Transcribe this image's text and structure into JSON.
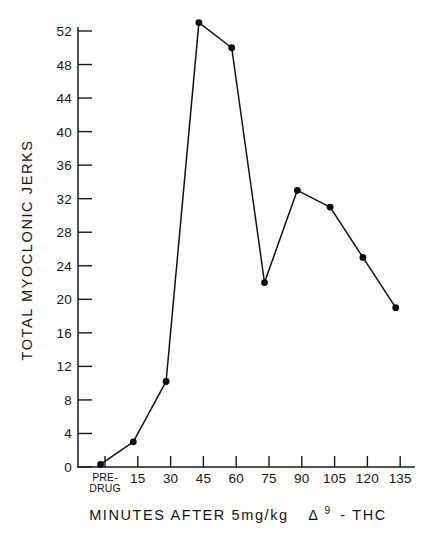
{
  "chart_data": {
    "type": "line",
    "title": "",
    "xlabel": "MINUTES AFTER  5mg/kg  Δ9 - THC",
    "xlabel_parts": {
      "main_prefix": "MINUTES  AFTER   5mg/kg",
      "delta": "Δ",
      "superscript": "9",
      "suffix": "- THC"
    },
    "ylabel": "TOTAL  MYOCLONIC  JERKS",
    "categories": [
      "PRE-DRUG",
      "15",
      "30",
      "45",
      "60",
      "75",
      "90",
      "105",
      "120",
      "135"
    ],
    "xtick_labels": [
      "PRE-\nDRUG",
      "15",
      "30",
      "45",
      "60",
      "75",
      "90",
      "105",
      "120",
      "135"
    ],
    "xtick_label_line1": [
      "PRE-",
      "15",
      "30",
      "45",
      "60",
      "75",
      "90",
      "105",
      "120",
      "135"
    ],
    "xtick_label_line2": [
      "DRUG",
      "",
      "",
      "",
      "",
      "",
      "",
      "",
      "",
      ""
    ],
    "values": [
      0.3,
      3.0,
      10.2,
      53.0,
      50.0,
      22.0,
      33.0,
      31.0,
      25.0,
      19.0
    ],
    "ylim": [
      0,
      54
    ],
    "yticks": [
      0,
      4,
      8,
      12,
      16,
      20,
      24,
      28,
      32,
      36,
      40,
      44,
      48,
      52
    ],
    "ytick_labels": [
      "0",
      "4",
      "8",
      "12",
      "16",
      "20",
      "24",
      "28",
      "32",
      "36",
      "40",
      "44",
      "48",
      "52"
    ],
    "grid": false,
    "legend": null,
    "marker": "filled-circle",
    "marker_color": "#0d0d0d",
    "line_color": "#111111",
    "background_color": "#fdfdfc"
  },
  "figure": {
    "name": "total-myoclonic-jerks-vs-minutes-after-thc"
  }
}
